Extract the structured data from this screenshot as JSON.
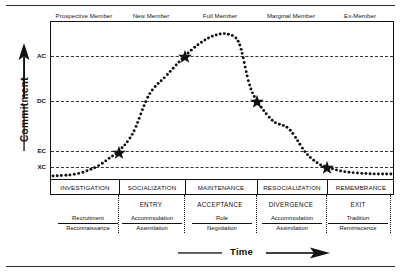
{
  "chart_data": {
    "type": "line",
    "xlabel": "Time",
    "ylabel": "Commitment",
    "grid": true,
    "legend": false,
    "x_axis": {
      "label": "Time",
      "arrow": "right",
      "ticks": []
    },
    "y_axis": {
      "label": "Commitment",
      "arrow": "up",
      "tick_labels": [
        "AC",
        "DC",
        "EC",
        "XC"
      ],
      "tick_positions_px": [
        55,
        100,
        150,
        166
      ],
      "tick_descriptions": [
        "AC - acceptance criterion",
        "DC - divergence criterion",
        "EC - entry criterion",
        "XC - exit criterion"
      ]
    },
    "series": [
      {
        "name": "Commitment",
        "style": "dotted",
        "points": [
          {
            "x": 0,
            "y": 2
          },
          {
            "x": 6,
            "y": 3
          },
          {
            "x": 12,
            "y": 5
          },
          {
            "x": 17,
            "y": 9
          },
          {
            "x": 20,
            "y": 14
          },
          {
            "x": 24,
            "y": 22
          },
          {
            "x": 30,
            "y": 36
          },
          {
            "x": 36,
            "y": 52
          },
          {
            "x": 42,
            "y": 68
          },
          {
            "x": 47,
            "y": 82
          },
          {
            "x": 52,
            "y": 92
          },
          {
            "x": 57,
            "y": 97
          },
          {
            "x": 60,
            "y": 100
          },
          {
            "x": 64,
            "y": 98
          },
          {
            "x": 68,
            "y": 92
          },
          {
            "x": 72,
            "y": 82
          },
          {
            "x": 77,
            "y": 68
          },
          {
            "x": 82,
            "y": 52
          },
          {
            "x": 87,
            "y": 34
          },
          {
            "x": 91,
            "y": 20
          },
          {
            "x": 94,
            "y": 12
          },
          {
            "x": 97,
            "y": 7
          },
          {
            "x": 100,
            "y": 4
          }
        ]
      }
    ],
    "markers": [
      {
        "label": "ENTRY",
        "level": "EC",
        "x_px": 118,
        "y_px": 152,
        "shape": "star"
      },
      {
        "label": "ACCEPTANCE",
        "level": "AC",
        "x_px": 184,
        "y_px": 56,
        "shape": "star"
      },
      {
        "label": "DIVERGENCE",
        "level": "DC",
        "x_px": 256,
        "y_px": 101,
        "shape": "star"
      },
      {
        "label": "EXIT",
        "level": "XC",
        "x_px": 326,
        "y_px": 167,
        "shape": "star"
      }
    ]
  },
  "member_stages": [
    {
      "label": "Prospective Member"
    },
    {
      "label": "New Member"
    },
    {
      "label": "Full Member"
    },
    {
      "label": "Marginal Member"
    },
    {
      "label": "Ex-Member"
    }
  ],
  "processes": [
    {
      "label": "INVESTIGATION"
    },
    {
      "label": "SOCIALIZATION"
    },
    {
      "label": "MAINTENANCE"
    },
    {
      "label": "RESOCIALIZATION"
    },
    {
      "label": "REMEMBRANCE"
    }
  ],
  "transitions": [
    {
      "label": "ENTRY"
    },
    {
      "label": "ACCEPTANCE"
    },
    {
      "label": "DIVERGENCE"
    },
    {
      "label": "EXIT"
    }
  ],
  "fractions": [
    {
      "numerator": "Recruitment",
      "denominator": "Reconnaissance"
    },
    {
      "numerator": "Accommodation",
      "denominator": "Assimilation"
    },
    {
      "numerator": "Role",
      "denominator": "Negotiation"
    },
    {
      "numerator": "Accommodation",
      "denominator": "Assimilation"
    },
    {
      "numerator": "Tradition",
      "denominator": "Reminiscence"
    }
  ],
  "axis_titles": {
    "y": "Commitment",
    "x": "Time"
  },
  "colors": {
    "ink": "#111111",
    "paper": "#ffffff",
    "grid": "#333333"
  }
}
